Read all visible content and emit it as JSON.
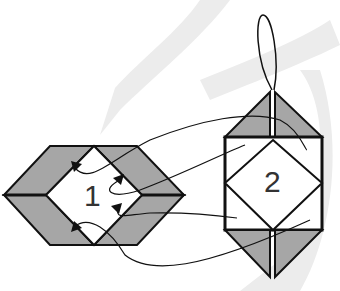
{
  "diagram": {
    "type": "origami-folding-diagram",
    "steps": [
      {
        "label": "1",
        "description": "flat hexagonal unit with inner diamond and four pockets (arrows)"
      },
      {
        "label": "2",
        "description": "unit assembled vertically with hanging loop on top"
      }
    ],
    "colors": {
      "fold_fill": "#a6a6a6",
      "line": "#111111",
      "watermark": "#ececec",
      "background": "#ffffff"
    }
  }
}
